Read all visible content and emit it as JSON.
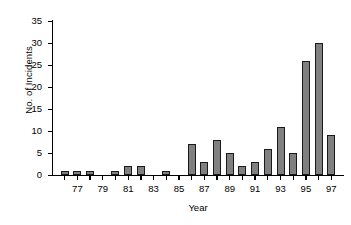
{
  "chart_data": {
    "type": "bar",
    "title": "",
    "xlabel": "Year",
    "ylabel": "No. of Incidents",
    "categories": [
      "76",
      "77",
      "78",
      "79",
      "80",
      "81",
      "82",
      "83",
      "84",
      "85",
      "86",
      "87",
      "88",
      "89",
      "90",
      "91",
      "92",
      "93",
      "94",
      "95",
      "96",
      "97"
    ],
    "values": [
      1,
      1,
      1,
      0,
      1,
      2,
      2,
      0,
      1,
      0,
      7,
      3,
      8,
      5,
      2,
      3,
      6,
      11,
      5,
      26,
      30,
      9
    ],
    "x_tick_labels": [
      "77",
      "79",
      "81",
      "83",
      "85",
      "87",
      "89",
      "91",
      "93",
      "95",
      "97"
    ],
    "y_tick_labels": [
      "0",
      "5",
      "10",
      "15",
      "20",
      "25",
      "30",
      "35"
    ],
    "y_ticks": [
      0,
      5,
      10,
      15,
      20,
      25,
      30,
      35
    ],
    "ylim": [
      0,
      35
    ],
    "grid": false,
    "legend": "none",
    "bar_fill_color": "#808080",
    "bar_edge_color": "#1a1a1a",
    "axis_color": "#000000",
    "background_color": "#ffffff"
  }
}
